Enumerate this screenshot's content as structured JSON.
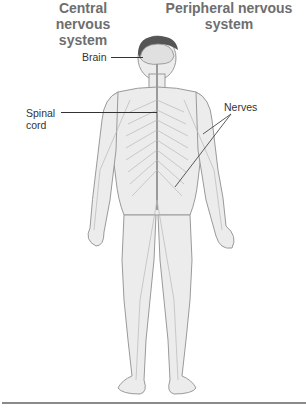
{
  "headings": {
    "central": "Central nervous system",
    "peripheral": "Peripheral nervous system"
  },
  "labels": {
    "brain": "Brain",
    "spinal_cord_line1": "Spinal",
    "spinal_cord_line2": "cord",
    "nerves": "Nerves"
  },
  "colors": {
    "heading": "#6e6e6e",
    "label": "#333333",
    "body_fill": "#ececec",
    "body_outline": "#9a9a9a",
    "nerve": "#b8b8b8"
  }
}
